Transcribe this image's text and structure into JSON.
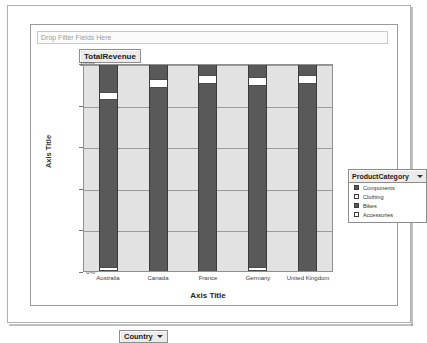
{
  "filter_zone": {
    "placeholder": "Drop Filter Fields Here"
  },
  "field_buttons": {
    "values": "TotalRevenue",
    "category": "Country"
  },
  "legend": {
    "title": "ProductCategory",
    "caret": "chevron-down-icon",
    "items": [
      {
        "label": "Components",
        "fill": "#595959"
      },
      {
        "label": "Clothing",
        "fill": "#ffffff"
      },
      {
        "label": "Bikes",
        "fill": "#595959"
      },
      {
        "label": "Accessories",
        "fill": "#ffffff"
      }
    ]
  },
  "chart_data": {
    "type": "bar",
    "title": "",
    "stacked": "100%",
    "xlabel": "Axis Title",
    "ylabel": "Axis Title",
    "ylim": [
      0,
      100
    ],
    "yticks": [
      "0%",
      "20%",
      "40%",
      "60%",
      "80%",
      "100%"
    ],
    "grid": true,
    "legend_position": "right",
    "categories": [
      "Australia",
      "Canada",
      "France",
      "Germany",
      "United Kingdom"
    ],
    "series": [
      {
        "name": "Components",
        "color": "#595959",
        "values": [
          13,
          7,
          5,
          6,
          5
        ]
      },
      {
        "name": "Clothing",
        "color": "#ffffff",
        "values": [
          4,
          4,
          4,
          4,
          4
        ]
      },
      {
        "name": "Bikes",
        "color": "#595959",
        "values": [
          81,
          89,
          91,
          88,
          91
        ]
      },
      {
        "name": "Accessories",
        "color": "#ffffff",
        "values": [
          2,
          0,
          0,
          2,
          0
        ]
      }
    ]
  }
}
